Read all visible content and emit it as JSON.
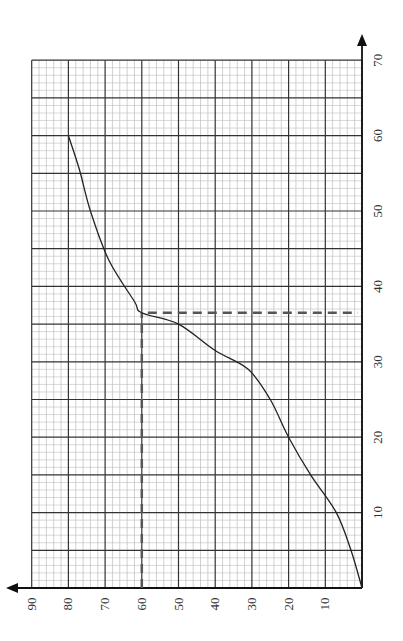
{
  "chart_data": {
    "type": "line",
    "title": "",
    "xlabel": "",
    "ylabel": "",
    "orientation_note": "graph paper rotated 90 degrees counter-clockwise",
    "x_axis": {
      "ticks": [
        10,
        20,
        30,
        40,
        50,
        60,
        70
      ],
      "range": [
        0,
        70
      ],
      "minor_step": 1,
      "major_step": 5
    },
    "y_axis": {
      "ticks": [
        10,
        20,
        30,
        40,
        50,
        60,
        70,
        80,
        90
      ],
      "range": [
        0,
        90
      ],
      "minor_step": 2,
      "major_step": 10
    },
    "grid": true,
    "series": [
      {
        "name": "curve",
        "x": [
          0,
          5,
          10,
          15,
          20,
          25,
          29,
          31.5,
          35,
          36.5,
          38,
          43.5,
          50,
          55.5,
          60
        ],
        "y": [
          0,
          3,
          7,
          14,
          20,
          25,
          31,
          40,
          50,
          60,
          62,
          69,
          74,
          77,
          80
        ]
      }
    ],
    "annotations": [
      {
        "type": "dashed-horizontal",
        "y": 60,
        "from_x": 0,
        "to_x": 36.5
      },
      {
        "type": "dashed-vertical",
        "x": 36.5,
        "from_y": 0,
        "to_y": 60
      }
    ]
  },
  "axis_labels": {
    "y_ticks": [
      "90",
      "80",
      "70",
      "60",
      "50",
      "40",
      "30",
      "20",
      "10"
    ],
    "x_ticks": [
      "70",
      "60",
      "50",
      "40",
      "30",
      "20",
      "10"
    ]
  },
  "colors": {
    "curve": "#222222",
    "dashed": "#555555",
    "grid_minor": "#bdbdbd",
    "grid_major": "#333333",
    "axis": "#111111"
  }
}
